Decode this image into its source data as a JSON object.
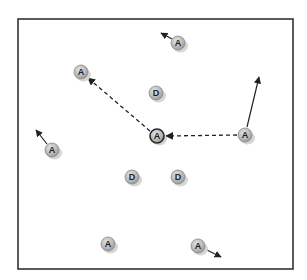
{
  "diagram": {
    "frame": {
      "x": 18,
      "y": 19,
      "width": 275,
      "height": 250,
      "stroke": "#333333"
    },
    "colors": {
      "node_fill": "#b8b8b8",
      "node_stroke": "#8a8a8a",
      "center_stroke": "#2a2a2a",
      "shadow": "#d6d6d6",
      "arrow": "#222222"
    },
    "nodes": [
      {
        "id": "a1",
        "label": "A",
        "x": 178,
        "y": 43
      },
      {
        "id": "a2",
        "label": "A",
        "x": 81,
        "y": 72
      },
      {
        "id": "d1",
        "label": "D",
        "x": 156,
        "y": 93
      },
      {
        "id": "a3",
        "label": "A",
        "x": 157,
        "y": 136,
        "center": true
      },
      {
        "id": "a4",
        "label": "A",
        "x": 245,
        "y": 135
      },
      {
        "id": "a5",
        "label": "A",
        "x": 52,
        "y": 150
      },
      {
        "id": "d2",
        "label": "D",
        "x": 132,
        "y": 177
      },
      {
        "id": "d3",
        "label": "D",
        "x": 178,
        "y": 177
      },
      {
        "id": "a6",
        "label": "A",
        "x": 108,
        "y": 244
      },
      {
        "id": "a7",
        "label": "A",
        "x": 198,
        "y": 246
      }
    ],
    "arrows": [
      {
        "id": "a1-motion",
        "from": [
          172,
          39
        ],
        "to": [
          161,
          33
        ],
        "style": "solid"
      },
      {
        "id": "a5-motion",
        "from": [
          47,
          144
        ],
        "to": [
          36,
          130
        ],
        "style": "solid"
      },
      {
        "id": "a4-motion",
        "from": [
          247,
          127
        ],
        "to": [
          259,
          77
        ],
        "style": "solid"
      },
      {
        "id": "a7-motion",
        "from": [
          205,
          249
        ],
        "to": [
          221,
          257
        ],
        "style": "solid"
      },
      {
        "id": "center-to-a2",
        "from": [
          150,
          131
        ],
        "to": [
          88,
          78
        ],
        "style": "dashed"
      },
      {
        "id": "a4-to-center",
        "from": [
          237,
          135
        ],
        "to": [
          166,
          136
        ],
        "style": "dashed"
      }
    ]
  }
}
